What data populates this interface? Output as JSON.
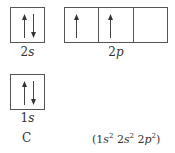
{
  "orbitals": [
    {
      "id": "2s",
      "label_num": "2",
      "label_letter": "s",
      "cells": [
        [
          "up",
          "down"
        ]
      ]
    },
    {
      "id": "2p",
      "label_num": "2",
      "label_letter": "p",
      "cells": [
        [
          "up"
        ],
        [
          "up"
        ],
        []
      ]
    },
    {
      "id": "1s",
      "label_num": "1",
      "label_letter": "s",
      "cells": [
        [
          "up",
          "down"
        ]
      ]
    }
  ],
  "element": "C",
  "configuration": {
    "open": "(",
    "parts": [
      {
        "n": "1",
        "l": "s",
        "e": "2"
      },
      {
        "n": "2",
        "l": "s",
        "e": "2"
      },
      {
        "n": "2",
        "l": "p",
        "e": "2"
      }
    ],
    "close": ")"
  }
}
